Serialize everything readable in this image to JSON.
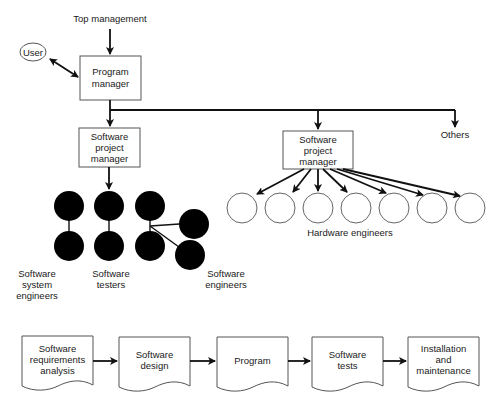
{
  "org_chart": {
    "top": "Top management",
    "user": "User",
    "program_manager": [
      "Program",
      "manager"
    ],
    "sw_project_manager_left": [
      "Software",
      "project",
      "manager"
    ],
    "sw_project_manager_right": [
      "Software",
      "project",
      "manager"
    ],
    "others": "Others",
    "groups": {
      "system_engineers": [
        "Software",
        "system",
        "engineers"
      ],
      "testers": [
        "Software",
        "testers"
      ],
      "sw_engineers": [
        "Software",
        "engineers"
      ],
      "hardware_engineers": "Hardware engineers"
    },
    "hardware_engineer_count": 7,
    "colors": {
      "software_staff": "#000000",
      "hardware_staff": "#ffffff",
      "stroke": "#111111"
    }
  },
  "process_flow": {
    "steps": [
      {
        "lines": [
          "Software",
          "requirements",
          "analysis"
        ]
      },
      {
        "lines": [
          "Software",
          "design"
        ]
      },
      {
        "lines": [
          "Program"
        ]
      },
      {
        "lines": [
          "Software",
          "tests"
        ]
      },
      {
        "lines": [
          "Installation",
          "and",
          "maintenance"
        ]
      }
    ]
  }
}
